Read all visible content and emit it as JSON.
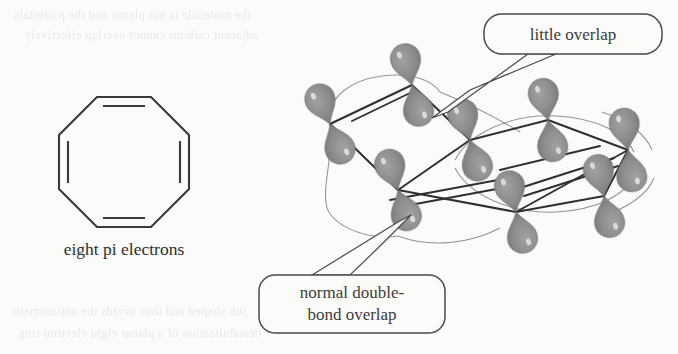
{
  "figure": {
    "kind": "chemistry-structure-diagram",
    "background_color": "#fbfbfa"
  },
  "flat_structure": {
    "name": "cyclooctatetraene-skeletal-octagon",
    "caption": "eight pi electrons",
    "ring_size": 8,
    "double_bond_count": 4,
    "double_bond_edges": [
      "top",
      "right",
      "bottom",
      "left"
    ],
    "line_color": "#3a3a3a"
  },
  "orbital_model": {
    "name": "tub-shaped-p-orbital-model",
    "vertex_count": 8,
    "lobes_per_vertex": 2,
    "lobe_color": "#8e8e8e",
    "lobe_edge_color": "#6f6f6f",
    "bond_color": "#2f2f2f",
    "guide_curve_color": "#8a8a8a"
  },
  "callouts": [
    {
      "id": "little-overlap",
      "text": "little overlap",
      "box": {
        "x": 484,
        "y": 14,
        "w": 178,
        "h": 40,
        "radius": 18
      },
      "border_color": "#4a4a4a",
      "tail_tip": {
        "x": 432,
        "y": 118
      }
    },
    {
      "id": "normal-double-bond-overlap",
      "line1": "normal double-",
      "line2": "bond overlap",
      "box": {
        "x": 259,
        "y": 275,
        "w": 186,
        "h": 58,
        "radius": 16
      },
      "border_color": "#4a4a4a",
      "tail_tip": {
        "x": 411,
        "y": 215
      }
    }
  ],
  "ghost_text": {
    "note": "faint show-through text from reverse page",
    "top_lines": [
      "the molecule is not planar and the p orbitals",
      "adjacent carbons cannot overlap effectively"
    ],
    "bottom_lines": [
      "tub shaped and thus avoids the antiaromatic",
      "destabilization of a planar eight electron ring"
    ]
  }
}
